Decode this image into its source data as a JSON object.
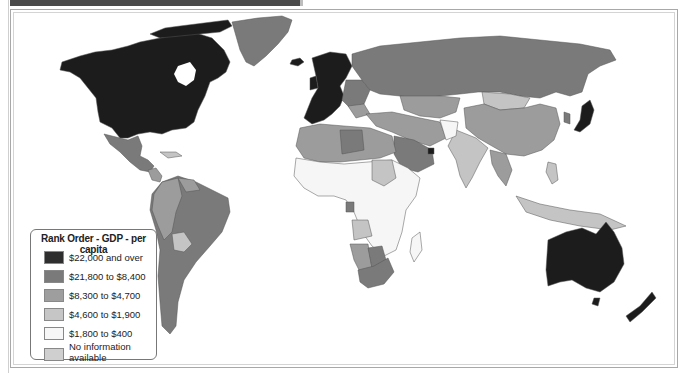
{
  "map": {
    "type": "choropleth world map",
    "subject": "GDP per capita, rank order",
    "colors": {
      "tier1": "#1c1c1c",
      "tier2": "#7a7a7a",
      "tier3": "#9c9c9c",
      "tier4": "#c4c4c4",
      "tier5": "#f6f6f6",
      "no_info": "#cdcdcd",
      "border": "#555555"
    }
  },
  "legend": {
    "title": "Rank Order - GDP - per capita",
    "items": [
      {
        "label": "$22,000 and over",
        "color": "#2e2e2e"
      },
      {
        "label": "$21,800 to $8,400",
        "color": "#7a7a7a"
      },
      {
        "label": "$8,300 to $4,700",
        "color": "#9e9e9e"
      },
      {
        "label": "$4,600 to $1,900",
        "color": "#c6c6c6"
      },
      {
        "label": "$1,800 to $400",
        "color": "#f7f7f7"
      },
      {
        "label": "No information available",
        "color": "#cfcfcf"
      }
    ]
  }
}
